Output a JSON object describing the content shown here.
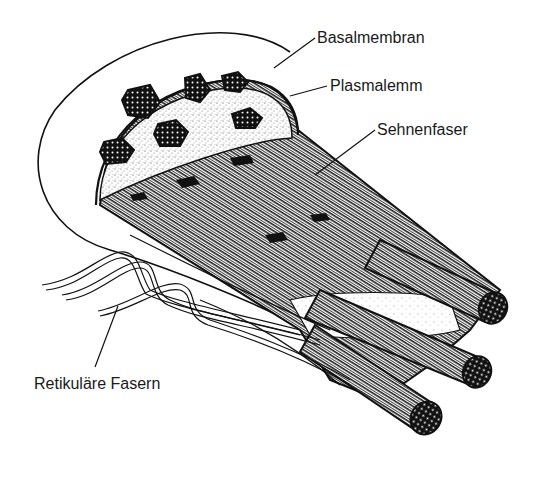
{
  "figure": {
    "colors": {
      "ink": "#111111",
      "paper": "#ffffff",
      "stipple": "#555555"
    }
  },
  "labels": {
    "basalmembran": "Basalmembran",
    "plasmalemm": "Plasmalemm",
    "sehnenfaser": "Sehnenfaser",
    "retikulaere_fasern": "Retikuläre Fasern"
  }
}
